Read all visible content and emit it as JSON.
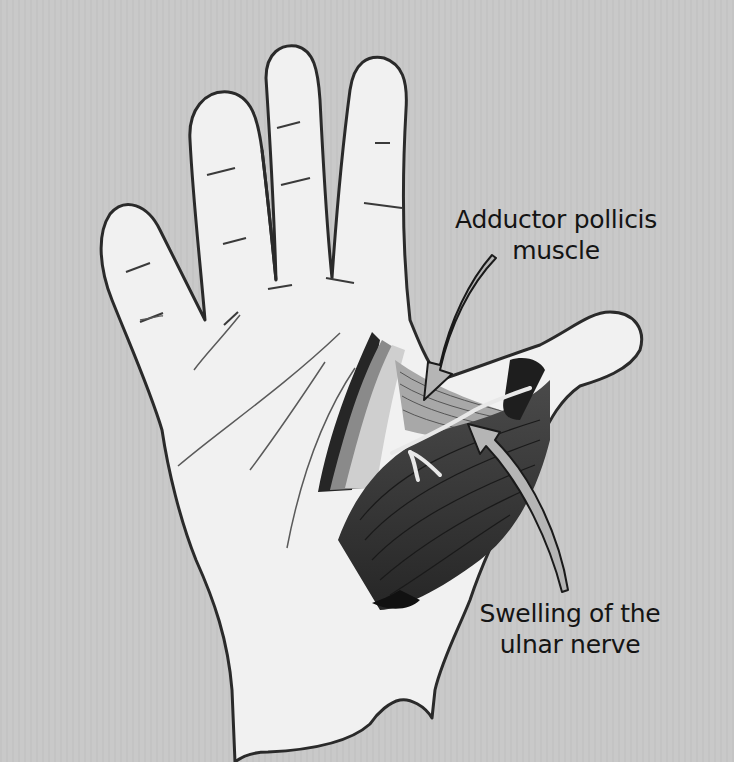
{
  "figure": {
    "background_color": "#c9c9c9",
    "skin_color": "#f1f1f1",
    "outline_color": "#2a2a2a",
    "muscle_dark_color": "#3a3a3a",
    "muscle_mid_color": "#8a8a8a",
    "arrow_fill_color": "#b5b5b5"
  },
  "labels": {
    "adductor": {
      "line1": "Adductor pollicis",
      "line2": "muscle"
    },
    "ulnar": {
      "line1": "Swelling of the",
      "line2": "ulnar nerve"
    }
  }
}
